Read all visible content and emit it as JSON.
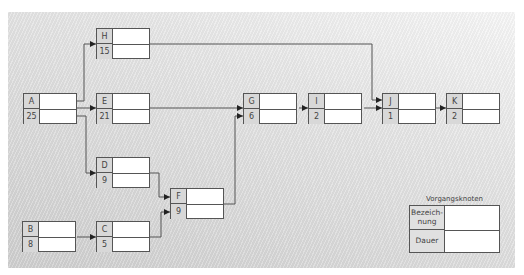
{
  "diagram": {
    "type": "activity-on-node network",
    "nodes": [
      {
        "id": "A",
        "label": "A",
        "duration": "25"
      },
      {
        "id": "B",
        "label": "B",
        "duration": "8"
      },
      {
        "id": "C",
        "label": "C",
        "duration": "5"
      },
      {
        "id": "D",
        "label": "D",
        "duration": "9"
      },
      {
        "id": "E",
        "label": "E",
        "duration": "21"
      },
      {
        "id": "F",
        "label": "F",
        "duration": "9"
      },
      {
        "id": "G",
        "label": "G",
        "duration": "6"
      },
      {
        "id": "H",
        "label": "H",
        "duration": "15"
      },
      {
        "id": "I",
        "label": "I",
        "duration": "2"
      },
      {
        "id": "J",
        "label": "J",
        "duration": "1"
      },
      {
        "id": "K",
        "label": "K",
        "duration": "2"
      }
    ],
    "edges": [
      {
        "from": "A",
        "to": "H"
      },
      {
        "from": "A",
        "to": "E"
      },
      {
        "from": "A",
        "to": "D"
      },
      {
        "from": "B",
        "to": "C"
      },
      {
        "from": "D",
        "to": "F"
      },
      {
        "from": "C",
        "to": "F"
      },
      {
        "from": "E",
        "to": "G"
      },
      {
        "from": "F",
        "to": "G"
      },
      {
        "from": "G",
        "to": "I"
      },
      {
        "from": "H",
        "to": "J"
      },
      {
        "from": "I",
        "to": "J"
      },
      {
        "from": "J",
        "to": "K"
      }
    ]
  },
  "legend": {
    "title": "Vorgangsknoten",
    "name_label": "Bezeich-\nnung",
    "duration_label": "Dauer"
  },
  "colors": {
    "line": "#555555",
    "label_fill": "#d8d8d8",
    "cell_fill": "#ffffff"
  }
}
